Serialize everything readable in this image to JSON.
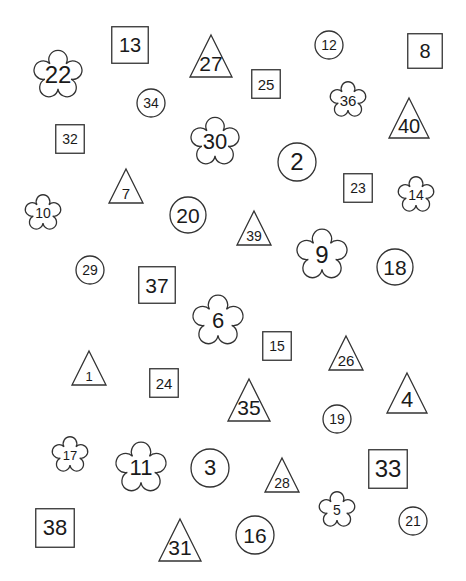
{
  "page": {
    "background": "#ffffff",
    "stroke_color": "#333333",
    "text_color": "#1a1a1a"
  },
  "shapes": [
    {
      "type": "flower",
      "label": "22",
      "cx": 58,
      "cy": 75,
      "size": 46,
      "font": 24
    },
    {
      "type": "square",
      "label": "13",
      "cx": 130,
      "cy": 45,
      "size": 38,
      "font": 20
    },
    {
      "type": "triangle",
      "label": "27",
      "cx": 211,
      "cy": 56,
      "size": 44,
      "font": 21
    },
    {
      "type": "circle",
      "label": "12",
      "cx": 329,
      "cy": 45,
      "size": 30,
      "font": 14
    },
    {
      "type": "square",
      "label": "8",
      "cx": 425,
      "cy": 51,
      "size": 36,
      "font": 20
    },
    {
      "type": "square",
      "label": "25",
      "cx": 266,
      "cy": 84,
      "size": 30,
      "font": 15
    },
    {
      "type": "circle",
      "label": "34",
      "cx": 151,
      "cy": 103,
      "size": 30,
      "font": 14
    },
    {
      "type": "flower",
      "label": "36",
      "cx": 348,
      "cy": 100,
      "size": 34,
      "font": 15
    },
    {
      "type": "triangle",
      "label": "40",
      "cx": 409,
      "cy": 118,
      "size": 42,
      "font": 20
    },
    {
      "type": "square",
      "label": "32",
      "cx": 70,
      "cy": 139,
      "size": 30,
      "font": 14
    },
    {
      "type": "flower",
      "label": "30",
      "cx": 215,
      "cy": 142,
      "size": 46,
      "font": 22
    },
    {
      "type": "circle",
      "label": "2",
      "cx": 297,
      "cy": 162,
      "size": 40,
      "font": 24
    },
    {
      "type": "square",
      "label": "23",
      "cx": 358,
      "cy": 188,
      "size": 30,
      "font": 14
    },
    {
      "type": "flower",
      "label": "14",
      "cx": 416,
      "cy": 195,
      "size": 34,
      "font": 14
    },
    {
      "type": "triangle",
      "label": "7",
      "cx": 126,
      "cy": 186,
      "size": 36,
      "font": 15
    },
    {
      "type": "flower",
      "label": "10",
      "cx": 43,
      "cy": 213,
      "size": 34,
      "font": 14
    },
    {
      "type": "circle",
      "label": "20",
      "cx": 188,
      "cy": 215,
      "size": 38,
      "font": 21
    },
    {
      "type": "triangle",
      "label": "39",
      "cx": 254,
      "cy": 228,
      "size": 36,
      "font": 14
    },
    {
      "type": "flower",
      "label": "9",
      "cx": 322,
      "cy": 255,
      "size": 48,
      "font": 24
    },
    {
      "type": "circle",
      "label": "18",
      "cx": 395,
      "cy": 267,
      "size": 38,
      "font": 21
    },
    {
      "type": "circle",
      "label": "29",
      "cx": 90,
      "cy": 270,
      "size": 30,
      "font": 14
    },
    {
      "type": "square",
      "label": "37",
      "cx": 157,
      "cy": 285,
      "size": 38,
      "font": 21
    },
    {
      "type": "flower",
      "label": "6",
      "cx": 218,
      "cy": 321,
      "size": 48,
      "font": 22
    },
    {
      "type": "square",
      "label": "15",
      "cx": 277,
      "cy": 346,
      "size": 30,
      "font": 14
    },
    {
      "type": "triangle",
      "label": "26",
      "cx": 346,
      "cy": 353,
      "size": 36,
      "font": 15
    },
    {
      "type": "triangle",
      "label": "1",
      "cx": 89,
      "cy": 368,
      "size": 36,
      "font": 13
    },
    {
      "type": "square",
      "label": "24",
      "cx": 164,
      "cy": 383,
      "size": 30,
      "font": 15
    },
    {
      "type": "triangle",
      "label": "35",
      "cx": 249,
      "cy": 400,
      "size": 44,
      "font": 21
    },
    {
      "type": "circle",
      "label": "19",
      "cx": 337,
      "cy": 419,
      "size": 30,
      "font": 14
    },
    {
      "type": "triangle",
      "label": "4",
      "cx": 407,
      "cy": 393,
      "size": 42,
      "font": 22
    },
    {
      "type": "flower",
      "label": "17",
      "cx": 70,
      "cy": 455,
      "size": 34,
      "font": 13
    },
    {
      "type": "flower",
      "label": "11",
      "cx": 141,
      "cy": 468,
      "size": 48,
      "font": 22
    },
    {
      "type": "circle",
      "label": "3",
      "cx": 210,
      "cy": 468,
      "size": 40,
      "font": 22
    },
    {
      "type": "triangle",
      "label": "28",
      "cx": 282,
      "cy": 475,
      "size": 36,
      "font": 14
    },
    {
      "type": "square",
      "label": "33",
      "cx": 388,
      "cy": 469,
      "size": 40,
      "font": 24
    },
    {
      "type": "flower",
      "label": "5",
      "cx": 337,
      "cy": 510,
      "size": 34,
      "font": 14
    },
    {
      "type": "circle",
      "label": "21",
      "cx": 413,
      "cy": 521,
      "size": 30,
      "font": 14
    },
    {
      "type": "square",
      "label": "38",
      "cx": 55,
      "cy": 528,
      "size": 40,
      "font": 22
    },
    {
      "type": "triangle",
      "label": "31",
      "cx": 180,
      "cy": 540,
      "size": 44,
      "font": 21
    },
    {
      "type": "circle",
      "label": "16",
      "cx": 255,
      "cy": 535,
      "size": 40,
      "font": 21
    }
  ]
}
